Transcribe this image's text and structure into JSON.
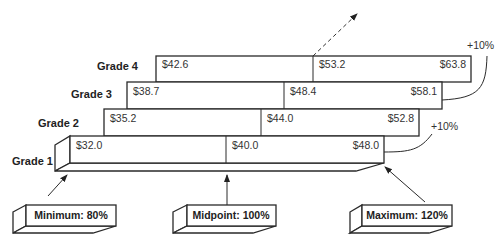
{
  "diagram": {
    "grades": [
      {
        "label": "Grade 4",
        "min": "$42.6",
        "mid": "$53.2",
        "max": "$63.8"
      },
      {
        "label": "Grade 3",
        "min": "$38.7",
        "mid": "$48.4",
        "max": "$58.1"
      },
      {
        "label": "Grade 2",
        "min": "$35.2",
        "mid": "$44.0",
        "max": "$52.8"
      },
      {
        "label": "Grade 1",
        "min": "$32.0",
        "mid": "$40.0",
        "max": "$48.0"
      }
    ],
    "progression_labels": [
      "+10%",
      "+10%"
    ],
    "callouts": {
      "minimum": "Minimum: 80%",
      "midpoint": "Midpoint: 100%",
      "maximum": "Maximum: 120%"
    },
    "colors": {
      "line": "#2a2a2a",
      "fill": "#ffffff"
    }
  }
}
